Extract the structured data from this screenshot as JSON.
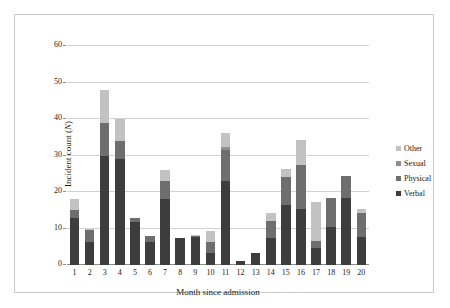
{
  "chart_data": {
    "type": "bar",
    "stacked": true,
    "title": "",
    "xlabel": "Month since admission",
    "ylabel": "Incident count (N)",
    "ylabel_plain": "Incident count (",
    "ylabel_italic": "N",
    "ylabel_tail": ")",
    "categories": [
      "1",
      "2",
      "3",
      "4",
      "5",
      "6",
      "7",
      "8",
      "9",
      "10",
      "11",
      "12",
      "13",
      "14",
      "15",
      "16",
      "17",
      "18",
      "19",
      "20"
    ],
    "ylim": [
      0,
      60
    ],
    "yticks": [
      0,
      10,
      20,
      30,
      40,
      50,
      60
    ],
    "ytick_labels": [
      "0",
      "10",
      "20",
      "30",
      "40",
      "50",
      "60"
    ],
    "grid": true,
    "grid_axis": "y",
    "legend_position": "right",
    "series": [
      {
        "name": "Verbal",
        "color": "#3d3d3d",
        "values": [
          13.0,
          6.3,
          30.0,
          29.0,
          11.7,
          6.3,
          18.0,
          7.3,
          7.7,
          3.4,
          23.0,
          1.0,
          3.4,
          7.4,
          16.4,
          15.4,
          4.6,
          10.4,
          18.4,
          7.6
        ]
      },
      {
        "name": "Physical",
        "color": "#6e6e6e",
        "values": [
          2.0,
          3.4,
          9.0,
          5.0,
          1.3,
          1.7,
          5.0,
          0.0,
          0.3,
          3.0,
          8.4,
          0.0,
          0.0,
          4.6,
          7.6,
          12.0,
          2.0,
          8.0,
          6.0,
          6.7
        ]
      },
      {
        "name": "Sexual",
        "color": "#8f8f8f",
        "values": [
          0.0,
          0.0,
          0.0,
          0.0,
          0.0,
          0.0,
          0.0,
          0.0,
          0.0,
          0.0,
          1.0,
          0.0,
          0.0,
          0.0,
          0.0,
          0.0,
          0.0,
          0.0,
          0.0,
          0.0
        ]
      },
      {
        "name": "Other",
        "color": "#c2c2c2",
        "values": [
          3.0,
          0.3,
          9.0,
          6.0,
          0.0,
          0.0,
          3.0,
          0.0,
          0.3,
          2.9,
          3.9,
          0.0,
          0.0,
          2.3,
          2.3,
          6.9,
          10.7,
          0.0,
          0.0,
          1.1
        ]
      }
    ],
    "totals": [
      18.0,
      10.0,
      48.0,
      40.0,
      13.0,
      8.0,
      26.0,
      7.3,
      8.3,
      9.3,
      36.3,
      1.0,
      3.4,
      14.3,
      26.3,
      34.3,
      17.3,
      18.4,
      24.4,
      15.4
    ]
  },
  "legend": {
    "items": [
      {
        "label": "Other",
        "color": "#c2c2c2"
      },
      {
        "label": "Sexual",
        "color": "#8f8f8f"
      },
      {
        "label": "Physical",
        "color": "#6e6e6e"
      },
      {
        "label": "Verbal",
        "color": "#3d3d3d"
      }
    ]
  },
  "axes": {
    "x_title": "Month since admission",
    "y_title_prefix": "Incident count (",
    "y_title_italic": "N",
    "y_title_suffix": ")"
  },
  "colors": {
    "gridline": "#d2d2d2",
    "axis": "#8d8d8d",
    "frame": "#c9c9c9",
    "background": "#ffffff",
    "text": "#1a1a1a"
  }
}
